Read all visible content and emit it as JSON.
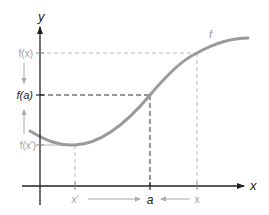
{
  "diagram": {
    "axes": {
      "x_label": "x",
      "y_label": "y"
    },
    "curve_label": "f",
    "y_ticks": [
      {
        "label": "f(x)",
        "y": 53,
        "emphasis": false
      },
      {
        "label": "f(a)",
        "y": 95,
        "emphasis": true
      },
      {
        "label": "f(x')",
        "y": 145,
        "emphasis": false
      }
    ],
    "x_ticks": [
      {
        "label": "x'",
        "x": 75,
        "emphasis": false
      },
      {
        "label": "a",
        "x": 150,
        "emphasis": true
      },
      {
        "label": "x",
        "x": 197,
        "emphasis": false
      }
    ],
    "colors": {
      "axis": "#222222",
      "curve": "#9a9a9a",
      "guide_dark": "#333333",
      "guide_light": "#b5b5b5",
      "label_dark": "#222222",
      "label_light": "#a0a0a0"
    }
  }
}
